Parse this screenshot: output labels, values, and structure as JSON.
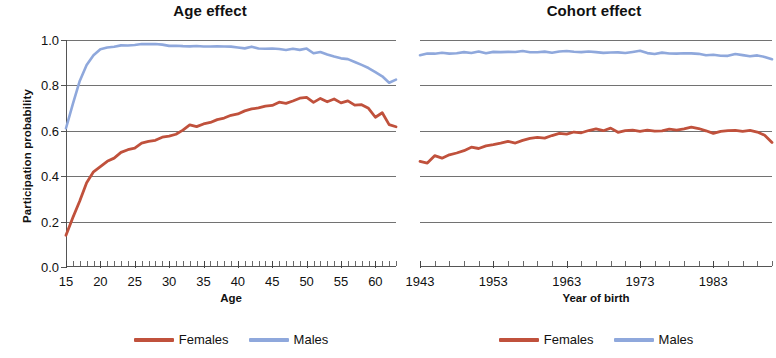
{
  "figure": {
    "series_colors": {
      "females": "#C0513C",
      "males": "#8FA8DC"
    },
    "grid_color": "#4a4a4a"
  },
  "legend": {
    "females_label": "Females",
    "males_label": "Males"
  },
  "chart_data": [
    {
      "type": "line",
      "title": "Age effect",
      "xlabel": "Age",
      "ylabel": "Participation probability",
      "xlim": [
        15,
        63
      ],
      "ylim": [
        0.0,
        1.0
      ],
      "yticks": [
        0.0,
        0.2,
        0.4,
        0.6,
        0.8,
        1.0
      ],
      "ytick_labels": [
        "0.0",
        "0.2",
        "0.4",
        "0.6",
        "0.8",
        "1.0"
      ],
      "xticks": [
        15,
        20,
        25,
        30,
        35,
        40,
        45,
        50,
        55,
        60
      ],
      "xtick_labels": [
        "15",
        "20",
        "25",
        "30",
        "35",
        "40",
        "45",
        "50",
        "55",
        "60"
      ],
      "grid": true,
      "legend_position": "below",
      "x": [
        15,
        16,
        17,
        18,
        19,
        20,
        21,
        22,
        23,
        24,
        25,
        26,
        27,
        28,
        29,
        30,
        31,
        32,
        33,
        34,
        35,
        36,
        37,
        38,
        39,
        40,
        41,
        42,
        43,
        44,
        45,
        46,
        47,
        48,
        49,
        50,
        51,
        52,
        53,
        54,
        55,
        56,
        57,
        58,
        59,
        60,
        61,
        62,
        63
      ],
      "series": [
        {
          "name": "Females",
          "values": [
            0.14,
            0.215,
            0.29,
            0.37,
            0.42,
            0.445,
            0.465,
            0.48,
            0.505,
            0.515,
            0.525,
            0.545,
            0.552,
            0.56,
            0.572,
            0.578,
            0.586,
            0.6,
            0.625,
            0.618,
            0.63,
            0.64,
            0.65,
            0.655,
            0.668,
            0.672,
            0.688,
            0.698,
            0.7,
            0.71,
            0.712,
            0.725,
            0.722,
            0.73,
            0.742,
            0.748,
            0.725,
            0.745,
            0.73,
            0.738,
            0.722,
            0.73,
            0.712,
            0.718,
            0.7,
            0.66,
            0.68,
            0.625,
            0.618
          ]
        },
        {
          "name": "Males",
          "values": [
            0.61,
            0.72,
            0.82,
            0.89,
            0.935,
            0.958,
            0.965,
            0.97,
            0.975,
            0.978,
            0.98,
            0.982,
            0.982,
            0.98,
            0.978,
            0.976,
            0.975,
            0.974,
            0.973,
            0.972,
            0.972,
            0.971,
            0.97,
            0.972,
            0.97,
            0.968,
            0.966,
            0.97,
            0.962,
            0.96,
            0.96,
            0.962,
            0.958,
            0.962,
            0.958,
            0.96,
            0.94,
            0.948,
            0.935,
            0.928,
            0.92,
            0.915,
            0.905,
            0.89,
            0.875,
            0.858,
            0.838,
            0.812,
            0.828
          ]
        }
      ]
    },
    {
      "type": "line",
      "title": "Cohort effect",
      "xlabel": "Year of birth",
      "ylabel": "Participation probability",
      "xlim": [
        1943,
        1991
      ],
      "ylim": [
        0.0,
        1.0
      ],
      "yticks": [
        0.0,
        0.2,
        0.4,
        0.6,
        0.8,
        1.0
      ],
      "ytick_labels": [
        "",
        "",
        "",
        "",
        "",
        ""
      ],
      "xticks": [
        1943,
        1953,
        1963,
        1973,
        1983
      ],
      "xtick_labels": [
        "1943",
        "1953",
        "1963",
        "1973",
        "1983"
      ],
      "grid": true,
      "legend_position": "below",
      "x": [
        1943,
        1944,
        1945,
        1946,
        1947,
        1948,
        1949,
        1950,
        1951,
        1952,
        1953,
        1954,
        1955,
        1956,
        1957,
        1958,
        1959,
        1960,
        1961,
        1962,
        1963,
        1964,
        1965,
        1966,
        1967,
        1968,
        1969,
        1970,
        1971,
        1972,
        1973,
        1974,
        1975,
        1976,
        1977,
        1978,
        1979,
        1980,
        1981,
        1982,
        1983,
        1984,
        1985,
        1986,
        1987,
        1988,
        1989,
        1990,
        1991
      ],
      "series": [
        {
          "name": "Females",
          "values": [
            0.465,
            0.455,
            0.49,
            0.478,
            0.495,
            0.505,
            0.512,
            0.528,
            0.522,
            0.532,
            0.54,
            0.545,
            0.552,
            0.548,
            0.558,
            0.568,
            0.572,
            0.565,
            0.578,
            0.588,
            0.585,
            0.598,
            0.592,
            0.6,
            0.608,
            0.598,
            0.612,
            0.595,
            0.6,
            0.604,
            0.598,
            0.602,
            0.6,
            0.598,
            0.606,
            0.604,
            0.608,
            0.618,
            0.612,
            0.598,
            0.588,
            0.596,
            0.6,
            0.605,
            0.598,
            0.602,
            0.595,
            0.578,
            0.548
          ]
        },
        {
          "name": "Males",
          "values": [
            0.932,
            0.942,
            0.94,
            0.944,
            0.942,
            0.94,
            0.945,
            0.942,
            0.948,
            0.944,
            0.95,
            0.946,
            0.948,
            0.945,
            0.95,
            0.948,
            0.946,
            0.95,
            0.945,
            0.948,
            0.952,
            0.948,
            0.945,
            0.95,
            0.946,
            0.944,
            0.948,
            0.945,
            0.942,
            0.946,
            0.95,
            0.944,
            0.94,
            0.945,
            0.942,
            0.938,
            0.94,
            0.942,
            0.938,
            0.934,
            0.936,
            0.93,
            0.932,
            0.938,
            0.932,
            0.928,
            0.93,
            0.926,
            0.918
          ]
        }
      ]
    }
  ]
}
